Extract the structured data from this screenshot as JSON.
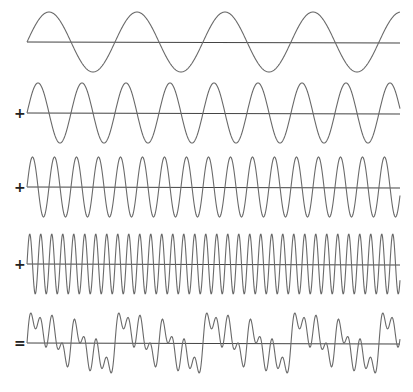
{
  "colors": {
    "wave": "#6a6a6a",
    "axis": "#444444",
    "background": "#ffffff"
  },
  "geometry": {
    "x_start": 27,
    "x_end": 400,
    "period_px": 88,
    "amplitude_px": 30
  },
  "rows": [
    {
      "operator": "",
      "frequency": 1,
      "baseline_y": 42,
      "kind": "sine"
    },
    {
      "operator": "+",
      "frequency": 2,
      "baseline_y": 113,
      "kind": "sine"
    },
    {
      "operator": "+",
      "frequency": 4,
      "baseline_y": 187,
      "kind": "sine"
    },
    {
      "operator": "+",
      "frequency": 8,
      "baseline_y": 264,
      "kind": "sine"
    },
    {
      "operator": "=",
      "frequency": 0,
      "baseline_y": 343,
      "kind": "sum"
    }
  ],
  "chart_data": {
    "type": "line",
    "title": "",
    "xlabel": "",
    "ylabel": "",
    "grid": false,
    "series": [
      {
        "name": "sin(x)",
        "frequency": 1,
        "amplitude": 1
      },
      {
        "name": "sin(2x)",
        "frequency": 2,
        "amplitude": 1
      },
      {
        "name": "sin(4x)",
        "frequency": 4,
        "amplitude": 1
      },
      {
        "name": "sin(8x)",
        "frequency": 8,
        "amplitude": 1
      },
      {
        "name": "sum",
        "components": [
          1,
          2,
          4,
          8
        ],
        "normalized": true
      }
    ],
    "cycles_of_fundamental": 4.24,
    "operators": [
      "",
      "+",
      "+",
      "+",
      "="
    ]
  }
}
